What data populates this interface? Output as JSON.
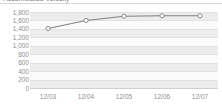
{
  "widget": {
    "title": "Accumulated Velocity",
    "title_clipped": true
  },
  "chart_data": {
    "type": "line",
    "title": "Accumulated Velocity",
    "xlabel": "",
    "ylabel": "",
    "categories": [
      "12/03",
      "12/04",
      "12/05",
      "12/06",
      "12/07"
    ],
    "x": [
      "12/03",
      "12/04",
      "12/05",
      "12/06",
      "12/07"
    ],
    "series": [
      {
        "name": "Accumulated",
        "values": [
          1410,
          1600,
          1700,
          1710,
          1710
        ]
      }
    ],
    "values": [
      1410,
      1600,
      1700,
      1710,
      1710
    ],
    "ylim": [
      0,
      1800
    ],
    "ytick_step": 200,
    "yticks": [
      1800,
      1600,
      1400,
      1200,
      1000,
      800,
      600,
      400,
      200,
      0
    ],
    "ytick_labels": [
      "1,800",
      "1,600",
      "1,400",
      "1,200",
      "1,000",
      "800",
      "600",
      "400",
      "200",
      "0"
    ],
    "xtick_labels": [
      "12/03",
      "12/04",
      "12/05",
      "12/06",
      "12/07"
    ],
    "grid": true,
    "grid_style": "alternating-horizontal-bands",
    "legend": false,
    "legend_position": "none",
    "marker": "circle-hollow",
    "colors": {
      "line": "#808080",
      "marker_fill": "#ffffff",
      "marker_stroke": "#808080",
      "band": "#ececec",
      "gridline": "#e2e2e2",
      "plot_background": "#fbfbfb",
      "axis_text": "#8f8f8f",
      "page_background": "#ffffff"
    }
  }
}
